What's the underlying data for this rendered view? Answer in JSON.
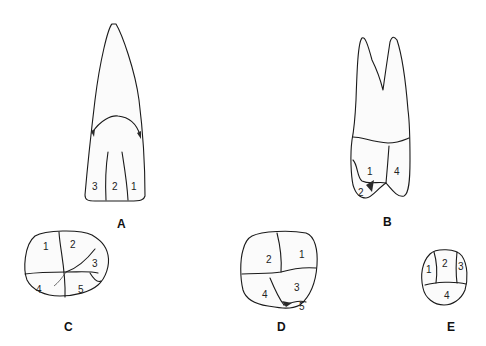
{
  "figure": {
    "panels": [
      {
        "id": "A",
        "label": "A",
        "numbers": [
          "3",
          "2",
          "1"
        ]
      },
      {
        "id": "B",
        "label": "B",
        "numbers": [
          "1",
          "4",
          "2"
        ]
      },
      {
        "id": "C",
        "label": "C",
        "numbers": [
          "1",
          "2",
          "3",
          "4",
          "5"
        ]
      },
      {
        "id": "D",
        "label": "D",
        "numbers": [
          "2",
          "1",
          "3",
          "4",
          "5"
        ]
      },
      {
        "id": "E",
        "label": "E",
        "numbers": [
          "1",
          "2",
          "3",
          "4"
        ]
      }
    ]
  }
}
